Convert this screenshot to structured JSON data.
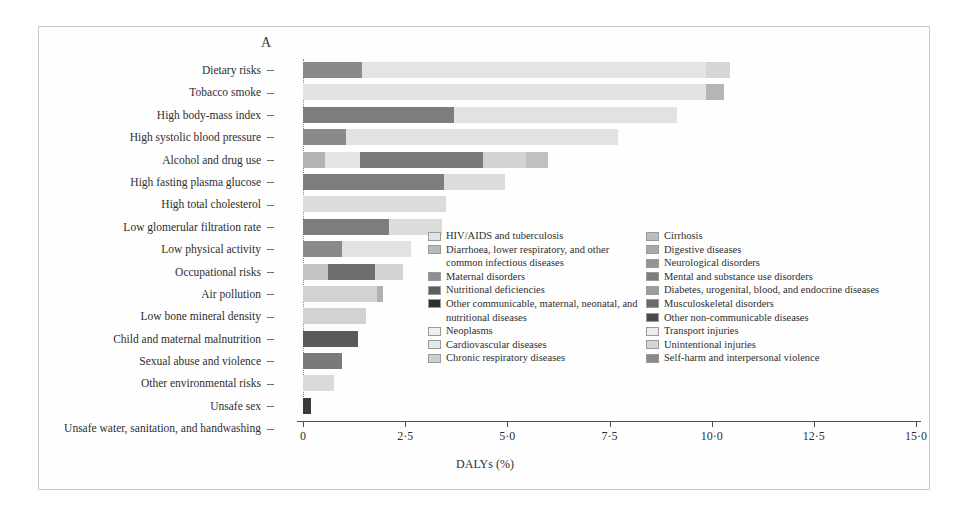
{
  "panel": {
    "label": "A"
  },
  "axis": {
    "x_title": "DALYs (%)",
    "x_ticks": [
      "0",
      "2·5",
      "5·0",
      "7·5",
      "10·0",
      "12·5",
      "15·0"
    ],
    "x_tick_values": [
      0,
      2.5,
      5.0,
      7.5,
      10.0,
      12.5,
      15.0
    ],
    "x_min": 0,
    "x_max": 15.0
  },
  "legend": {
    "left_column": [
      {
        "name": "HIV/AIDS and tuberculosis",
        "color": "#e2e2e2"
      },
      {
        "name": "Diarrhoea, lower respiratory, and other common infectious diseases",
        "color": "#b9b9b9"
      },
      {
        "name": "Maternal disorders",
        "color": "#8f8f8f"
      },
      {
        "name": "Nutritional deficiencies",
        "color": "#5e5e5e"
      },
      {
        "name": "Other communicable, maternal, neonatal, and nutritional diseases",
        "color": "#2f2f2f"
      },
      {
        "name": "Neoplasms",
        "color": "#f0f0f0"
      },
      {
        "name": "Cardiovascular diseases",
        "color": "#e6e6e6"
      },
      {
        "name": "Chronic respiratory diseases",
        "color": "#cfcfcf"
      }
    ],
    "right_column": [
      {
        "name": "Cirrhosis",
        "color": "#bdbdbd"
      },
      {
        "name": "Digestive diseases",
        "color": "#a8a8a8"
      },
      {
        "name": "Neurological disorders",
        "color": "#949494"
      },
      {
        "name": "Mental and substance use disorders",
        "color": "#7c7c7c"
      },
      {
        "name": "Diabetes, urogenital, blood, and endocrine diseases",
        "color": "#9d9d9d"
      },
      {
        "name": "Musculoskeletal disorders",
        "color": "#6a6a6a"
      },
      {
        "name": "Other non-communicable diseases",
        "color": "#4a4a4a"
      },
      {
        "name": "Transport injuries",
        "color": "#ededed"
      },
      {
        "name": "Unintentional injuries",
        "color": "#d5d5d5"
      },
      {
        "name": "Self-harm and interpersonal violence",
        "color": "#8a8a8a"
      }
    ]
  },
  "chart_data": {
    "type": "bar",
    "orientation": "horizontal",
    "stacked": true,
    "title": "A",
    "xlabel": "DALYs (%)",
    "ylabel": "",
    "xlim": [
      0,
      15.0
    ],
    "grid": false,
    "legend_position": "inside-right",
    "categories": [
      "Dietary risks",
      "Tobacco smoke",
      "High body-mass index",
      "High systolic blood pressure",
      "Alcohol and drug use",
      "High fasting plasma glucose",
      "High total cholesterol",
      "Low glomerular filtration rate",
      "Low physical activity",
      "Occupational risks",
      "Air pollution",
      "Low bone mineral density",
      "Child and maternal malnutrition",
      "Sexual abuse and violence",
      "Other environmental risks",
      "Unsafe sex",
      "Unsafe water, sanitation, and handwashing"
    ],
    "totals": [
      10.45,
      10.3,
      9.15,
      7.7,
      6.0,
      4.95,
      3.5,
      3.4,
      2.65,
      2.45,
      1.95,
      1.55,
      1.35,
      0.95,
      0.75,
      0.2,
      0.0
    ],
    "series": [
      {
        "name": "Cardiovascular diseases",
        "color": "#8f8f8f"
      },
      {
        "name": "Neoplasms",
        "color": "#e6e6e6"
      },
      {
        "name": "Diabetes, urogenital, blood, and endocrine diseases",
        "color": "#c4c4c4"
      },
      {
        "name": "Chronic respiratory diseases",
        "color": "#d8d8d8"
      },
      {
        "name": "Mental and substance use disorders",
        "color": "#7c7c7c"
      },
      {
        "name": "Musculoskeletal disorders",
        "color": "#6a6a6a"
      },
      {
        "name": "Other communicable, maternal, neonatal, and nutritional diseases",
        "color": "#2f2f2f"
      },
      {
        "name": "Unintentional injuries",
        "color": "#d5d5d5"
      }
    ],
    "bars": [
      {
        "category": "Dietary risks",
        "total": 10.45,
        "segments": [
          {
            "series": "Cardiovascular diseases",
            "value": 1.45,
            "color": "#8a8a8a"
          },
          {
            "series": "Neoplasms",
            "value": 8.4,
            "color": "#e4e4e4"
          },
          {
            "series": "Diabetes, urogenital, blood, and endocrine diseases",
            "value": 0.6,
            "color": "#d6d6d6"
          }
        ]
      },
      {
        "category": "Tobacco smoke",
        "total": 10.3,
        "segments": [
          {
            "series": "Cardiovascular diseases",
            "value": 9.85,
            "color": "#e2e2e2"
          },
          {
            "series": "Chronic respiratory diseases",
            "value": 0.45,
            "color": "#b5b5b5"
          }
        ]
      },
      {
        "category": "High body-mass index",
        "total": 9.15,
        "segments": [
          {
            "series": "Cardiovascular diseases",
            "value": 3.7,
            "color": "#7d7d7d"
          },
          {
            "series": "Neoplasms",
            "value": 5.45,
            "color": "#e2e2e2"
          }
        ]
      },
      {
        "category": "High systolic blood pressure",
        "total": 7.7,
        "segments": [
          {
            "series": "Cardiovascular diseases",
            "value": 1.05,
            "color": "#8a8a8a"
          },
          {
            "series": "Neoplasms",
            "value": 6.65,
            "color": "#e2e2e2"
          }
        ]
      },
      {
        "category": "Alcohol and drug use",
        "total": 6.0,
        "segments": [
          {
            "series": "Cardiovascular diseases",
            "value": 0.55,
            "color": "#b3b3b3"
          },
          {
            "series": "Neoplasms",
            "value": 0.85,
            "color": "#e6e6e6"
          },
          {
            "series": "Mental and substance use disorders",
            "value": 3.0,
            "color": "#7a7a7a"
          },
          {
            "series": "Unintentional injuries",
            "value": 1.05,
            "color": "#d2d2d2"
          },
          {
            "series": "Self-harm and interpersonal violence",
            "value": 0.55,
            "color": "#c0c0c0"
          }
        ]
      },
      {
        "category": "High fasting plasma glucose",
        "total": 4.95,
        "segments": [
          {
            "series": "Cardiovascular diseases",
            "value": 3.45,
            "color": "#7d7d7d"
          },
          {
            "series": "Diabetes, urogenital, blood, and endocrine diseases",
            "value": 1.5,
            "color": "#dcdcdc"
          }
        ]
      },
      {
        "category": "High total cholesterol",
        "total": 3.5,
        "segments": [
          {
            "series": "Cardiovascular diseases",
            "value": 3.5,
            "color": "#dcdcdc"
          }
        ]
      },
      {
        "category": "Low glomerular filtration rate",
        "total": 3.4,
        "segments": [
          {
            "series": "Cardiovascular diseases",
            "value": 2.1,
            "color": "#7d7d7d"
          },
          {
            "series": "Diabetes, urogenital, blood, and endocrine diseases",
            "value": 1.3,
            "color": "#dcdcdc"
          }
        ]
      },
      {
        "category": "Low physical activity",
        "total": 2.65,
        "segments": [
          {
            "series": "Cardiovascular diseases",
            "value": 0.95,
            "color": "#8a8a8a"
          },
          {
            "series": "Neoplasms",
            "value": 1.7,
            "color": "#e2e2e2"
          }
        ]
      },
      {
        "category": "Occupational risks",
        "total": 2.45,
        "segments": [
          {
            "series": "Chronic respiratory diseases",
            "value": 0.6,
            "color": "#c4c4c4"
          },
          {
            "series": "Musculoskeletal disorders",
            "value": 1.15,
            "color": "#6e6e6e"
          },
          {
            "series": "Unintentional injuries",
            "value": 0.7,
            "color": "#d2d2d2"
          }
        ]
      },
      {
        "category": "Air pollution",
        "total": 1.95,
        "segments": [
          {
            "series": "Chronic respiratory diseases",
            "value": 1.8,
            "color": "#d2d2d2"
          },
          {
            "series": "Neoplasms",
            "value": 0.15,
            "color": "#b0b0b0"
          }
        ]
      },
      {
        "category": "Low bone mineral density",
        "total": 1.55,
        "segments": [
          {
            "series": "Unintentional injuries",
            "value": 1.55,
            "color": "#d2d2d2"
          }
        ]
      },
      {
        "category": "Child and maternal malnutrition",
        "total": 1.35,
        "segments": [
          {
            "series": "Other communicable, maternal, neonatal, and nutritional diseases",
            "value": 1.35,
            "color": "#5a5a5a"
          }
        ]
      },
      {
        "category": "Sexual abuse and violence",
        "total": 0.95,
        "segments": [
          {
            "series": "Mental and substance use disorders",
            "value": 0.95,
            "color": "#7a7a7a"
          }
        ]
      },
      {
        "category": "Other environmental risks",
        "total": 0.75,
        "segments": [
          {
            "series": "Unintentional injuries",
            "value": 0.75,
            "color": "#dadada"
          }
        ]
      },
      {
        "category": "Unsafe sex",
        "total": 0.2,
        "segments": [
          {
            "series": "HIV/AIDS and tuberculosis",
            "value": 0.2,
            "color": "#3a3a3a"
          }
        ]
      },
      {
        "category": "Unsafe water, sanitation, and handwashing",
        "total": 0.0,
        "segments": []
      }
    ]
  }
}
